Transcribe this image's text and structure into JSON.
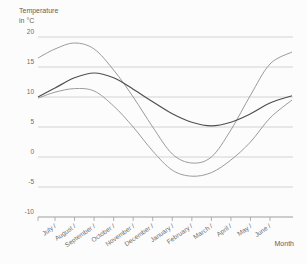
{
  "header": {
    "title_line1": "Temperature",
    "title_line2": "in °C"
  },
  "axes": {
    "x_title": "Month",
    "y_tick_suffix": "",
    "month_tick_labels": [
      "July /",
      "August /",
      "September /",
      "October /",
      "November /",
      "December /",
      "January /",
      "February /",
      "March /",
      "April /",
      "May /",
      "June /"
    ]
  },
  "colors": {
    "grid": "#c9c9c9",
    "axis": "#9e9e9e",
    "light_curve": "#9b9b9b",
    "dark_curve": "#4f4f4f",
    "text": "#6d6d6d"
  },
  "chart_data": {
    "type": "line",
    "title": "Temperature in °C",
    "xlabel": "Month",
    "ylabel": "Temperature in °C",
    "ylim": [
      -10,
      20
    ],
    "y_ticks": [
      20,
      15,
      10,
      5,
      0,
      -5,
      -10
    ],
    "grid": true,
    "legend": "none",
    "categories": [
      "July",
      "August",
      "September",
      "October",
      "November",
      "December",
      "January",
      "February",
      "March",
      "April",
      "May",
      "June"
    ],
    "series": [
      {
        "name": "light_curve_high_amplitude",
        "color": "#9b9b9b",
        "start_value": 16.5,
        "values": [
          18,
          19,
          18,
          14.5,
          10,
          5,
          0.5,
          -1,
          0,
          4.5,
          10.3,
          15.5
        ],
        "end_value": 17.5,
        "note_peak": "≈19 °C in August",
        "note_min": "≈-1 °C in late January"
      },
      {
        "name": "dark_curve_smooth",
        "color": "#4f4f4f",
        "start_value": 10,
        "values": [
          11.5,
          13.2,
          14,
          13.2,
          11.3,
          9.2,
          7.2,
          5.8,
          5.2,
          5.8,
          7.2,
          9
        ],
        "end_value": 10.2,
        "note_peak": "≈14 °C in September",
        "note_min": "≈5 °C in March"
      },
      {
        "name": "light_curve_low_amplitude",
        "color": "#9b9b9b",
        "start_value": 9.8,
        "values": [
          10.8,
          11.4,
          11,
          8.5,
          5,
          1,
          -2.2,
          -3.2,
          -2.6,
          -0.5,
          2.5,
          6.5
        ],
        "end_value": 9.5,
        "note_peak": "≈11.5 °C in September",
        "note_min": "≈-3.2 °C in February"
      }
    ]
  }
}
